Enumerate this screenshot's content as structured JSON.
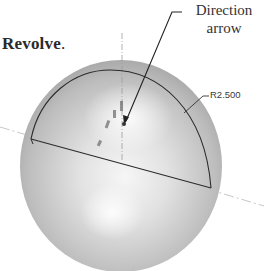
{
  "figure": {
    "instruction_word": "Revolve",
    "instruction_punctuation": ".",
    "callout": {
      "line1": "Direction",
      "line2": "arrow"
    },
    "dimension_label": "R2.500",
    "colors": {
      "sphere_light": "#f4f4f4",
      "sphere_dark": "#9a9a9a",
      "outline": "#2b2b2b",
      "axis": "#b0b0b0",
      "text": "#2a2a2a"
    }
  }
}
